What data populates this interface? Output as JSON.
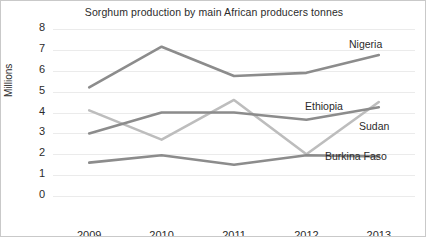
{
  "chart_data": {
    "type": "line",
    "title": "Sorghum production by main African producers tonnes",
    "xlabel": "",
    "ylabel": "Millions",
    "categories": [
      "2009",
      "2010",
      "2011",
      "2012",
      "2013"
    ],
    "x": [
      2009,
      2010,
      2011,
      2012,
      2013
    ],
    "ylim": [
      0,
      8
    ],
    "yticks": [
      "0",
      "1",
      "2",
      "3",
      "4",
      "5",
      "6",
      "7",
      "8"
    ],
    "grid": true,
    "legend_position": "inline-right-of-lines",
    "series": [
      {
        "name": "Nigeria",
        "values": [
          5.2,
          7.15,
          5.75,
          5.9,
          6.75
        ],
        "color": "#8c8c8c"
      },
      {
        "name": "Ethiopia",
        "values": [
          4.1,
          2.7,
          4.6,
          2.0,
          4.5
        ],
        "color": "#bdbdbd"
      },
      {
        "name": "Sudan",
        "values": [
          3.0,
          4.0,
          4.0,
          3.65,
          4.25
        ],
        "color": "#8c8c8c"
      },
      {
        "name": "Burkina Faso",
        "values": [
          1.6,
          1.95,
          1.5,
          1.95,
          1.9
        ],
        "color": "#8c8c8c"
      }
    ]
  },
  "labels": {
    "nigeria": "Nigeria",
    "ethiopia": "Ethiopia",
    "sudan": "Sudan",
    "burkina_faso": "Burkina Faso"
  }
}
